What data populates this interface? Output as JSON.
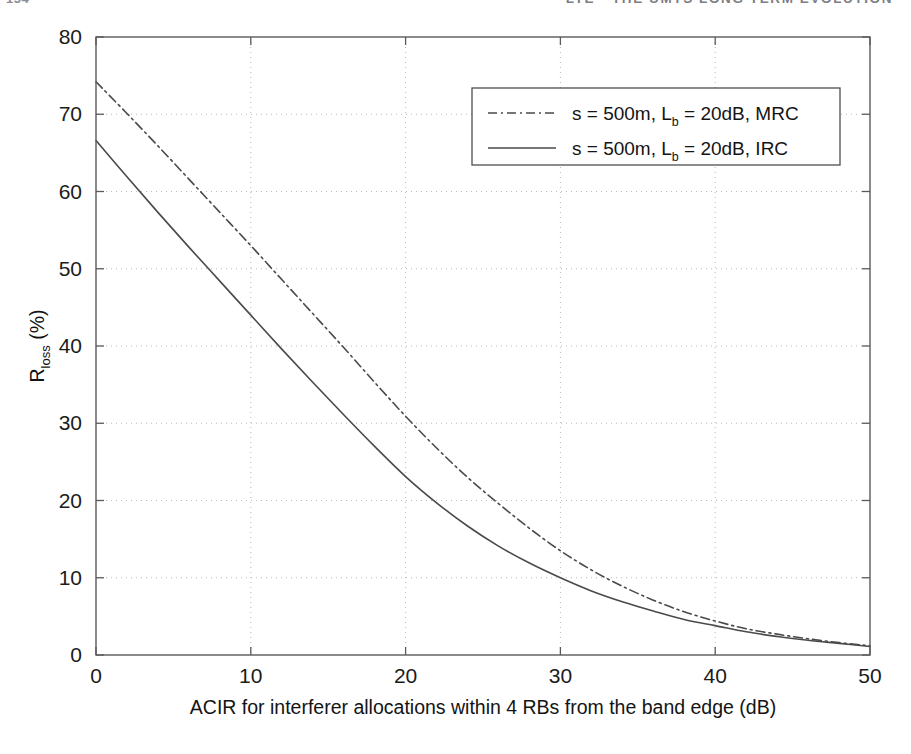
{
  "page": {
    "folio": "154",
    "running_head": "LTE - THE UMTS LONG TERM EVOLUTION"
  },
  "figure": {
    "name": "acir-rloss-figure"
  },
  "chart_data": {
    "type": "line",
    "title": "",
    "xlabel": "ACIR for interferer allocations within 4 RBs from the band edge (dB)",
    "ylabel": "R",
    "ylabel_sub": "loss",
    "ylabel_unit": " (%)",
    "xlim": [
      0,
      50
    ],
    "ylim": [
      0,
      80
    ],
    "xticks": [
      0,
      10,
      20,
      30,
      40,
      50
    ],
    "yticks": [
      0,
      10,
      20,
      30,
      40,
      50,
      60,
      70,
      80
    ],
    "xtick_labels": [
      "0",
      "10",
      "20",
      "30",
      "40",
      "50"
    ],
    "ytick_labels": [
      "0",
      "10",
      "20",
      "30",
      "40",
      "50",
      "60",
      "70",
      "80"
    ],
    "grid": true,
    "grid_style": "dotted",
    "legend_position": "upper right",
    "x": [
      0,
      2,
      4,
      6,
      8,
      10,
      12,
      14,
      16,
      18,
      20,
      22,
      24,
      26,
      28,
      30,
      32,
      34,
      36,
      38,
      40,
      42,
      44,
      46,
      48,
      50
    ],
    "series": [
      {
        "name": "s = 500m, L_b = 20dB, MRC",
        "label_main_1": "s = 500m, L",
        "label_sub": "b",
        "label_main_2": " = 20dB, MRC",
        "style": "dash-dot",
        "color": "#4a4a4a",
        "values": [
          74.2,
          70.1,
          65.9,
          61.6,
          57.3,
          53.0,
          48.6,
          44.2,
          39.8,
          35.3,
          30.9,
          26.8,
          23.0,
          19.6,
          16.4,
          13.5,
          11.0,
          8.9,
          7.1,
          5.6,
          4.4,
          3.4,
          2.7,
          2.1,
          1.6,
          1.2
        ]
      },
      {
        "name": "s = 500m, L_b = 20dB, IRC",
        "label_main_1": "s = 500m, L",
        "label_sub": "b",
        "label_main_2": " = 20dB, IRC",
        "style": "solid",
        "color": "#4a4a4a",
        "values": [
          66.6,
          61.9,
          57.3,
          52.8,
          48.4,
          44.0,
          39.6,
          35.3,
          31.1,
          27.0,
          23.1,
          19.7,
          16.7,
          14.1,
          11.9,
          10.0,
          8.3,
          6.9,
          5.7,
          4.6,
          3.8,
          3.0,
          2.4,
          1.9,
          1.5,
          1.1
        ]
      }
    ]
  }
}
